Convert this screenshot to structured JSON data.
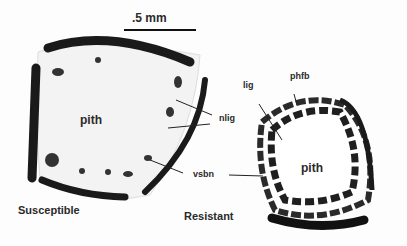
{
  "figure": {
    "scale_bar": {
      "label": ".5 mm"
    },
    "panels": [
      {
        "name": "Susceptible",
        "labels": {
          "pith": "pith",
          "nlig": "nlig",
          "vsbn": "vsbn"
        }
      },
      {
        "name": "Resistant",
        "labels": {
          "pith": "pith",
          "lig": "lig",
          "phfb": "phfb"
        }
      }
    ]
  }
}
